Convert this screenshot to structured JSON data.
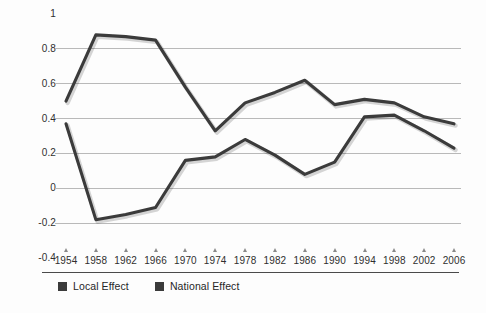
{
  "chart_data": {
    "type": "line",
    "title": "",
    "subtitle": "",
    "xlabel": "",
    "ylabel": "",
    "grid": true,
    "legend_position": "bottom-left",
    "x": [
      1954,
      1958,
      1962,
      1966,
      1970,
      1974,
      1978,
      1982,
      1986,
      1990,
      1994,
      1998,
      2002,
      2006
    ],
    "categories": [
      "1954",
      "1958",
      "1962",
      "1966",
      "1970",
      "1974",
      "1978",
      "1982",
      "1986",
      "1990",
      "1994",
      "1998",
      "2002",
      "2006"
    ],
    "xlim": [
      1954,
      2006
    ],
    "ylim": [
      -0.4,
      1
    ],
    "yticks": [
      1,
      0.8,
      0.6,
      0.4,
      0.2,
      0,
      -0.2,
      -0.4
    ],
    "ytick_labels": [
      "1",
      "0.8",
      "0.6",
      "0.4",
      "0.2",
      "0",
      "-0.2",
      "-0.4"
    ],
    "gridline_values": [
      0.8,
      0.6,
      0.4,
      0.2,
      0,
      -0.2
    ],
    "series": [
      {
        "name": "Local Effect",
        "color": "#3b3b3b",
        "values": [
          0.5,
          0.88,
          0.87,
          0.85,
          0.58,
          0.33,
          0.49,
          0.55,
          0.62,
          0.48,
          0.51,
          0.49,
          0.41,
          0.37
        ]
      },
      {
        "name": "National Effect",
        "color": "#3b3b3b",
        "values": [
          0.37,
          -0.18,
          -0.15,
          -0.11,
          0.16,
          0.18,
          0.28,
          0.19,
          0.08,
          0.15,
          0.41,
          0.42,
          0.33,
          0.23
        ]
      }
    ]
  },
  "legend": {
    "items": [
      {
        "label": "Local Effect",
        "color": "#3b3b3b"
      },
      {
        "label": "National Effect",
        "color": "#3b3b3b"
      }
    ]
  },
  "style": {
    "background": "#fdfdfd",
    "gridline_color": "#b9b9b9",
    "axis_rule_color": "#4a4a4a",
    "tick_mark_color": "#8a8a8a",
    "text_color": "#2f2f2f"
  }
}
